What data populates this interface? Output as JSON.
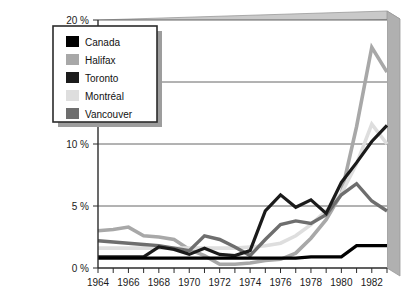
{
  "chart_data": {
    "type": "line",
    "title": "",
    "xlabel": "",
    "ylabel": "",
    "xlim": [
      1964,
      1983
    ],
    "ylim": [
      0,
      20
    ],
    "ytick_labels": [
      "0 %",
      "5 %",
      "10 %",
      "15 %",
      "20 %"
    ],
    "ytick_values": [
      0,
      5,
      10,
      15,
      20
    ],
    "xtick_values": [
      1964,
      1965,
      1966,
      1967,
      1968,
      1969,
      1970,
      1971,
      1972,
      1973,
      1974,
      1975,
      1976,
      1977,
      1978,
      1979,
      1980,
      1981,
      1982,
      1983
    ],
    "xtick_labels": [
      "1964",
      "1966",
      "1968",
      "1970",
      "1972",
      "1974",
      "1976",
      "1978",
      "1980",
      "1982"
    ],
    "xtick_label_values": [
      1964,
      1966,
      1968,
      1970,
      1972,
      1974,
      1976,
      1978,
      1980,
      1982
    ],
    "grid": "horizontal",
    "legend_position": "top-left",
    "x": [
      1964,
      1965,
      1966,
      1967,
      1968,
      1969,
      1970,
      1971,
      1972,
      1973,
      1974,
      1975,
      1976,
      1977,
      1978,
      1979,
      1980,
      1981,
      1982,
      1983
    ],
    "series": [
      {
        "name": "Canada",
        "color": "#000000",
        "width": 3.2,
        "values": [
          0.8,
          0.8,
          0.8,
          0.8,
          0.8,
          0.8,
          0.8,
          0.8,
          0.8,
          0.8,
          0.8,
          0.8,
          0.8,
          0.8,
          0.9,
          0.9,
          0.9,
          1.8,
          1.8,
          1.8
        ]
      },
      {
        "name": "Halifax",
        "color": "#a8a8a8",
        "width": 3.6,
        "values": [
          3.0,
          3.1,
          3.3,
          2.6,
          2.5,
          2.3,
          1.5,
          1.0,
          0.3,
          0.3,
          0.4,
          0.6,
          0.7,
          1.2,
          2.4,
          3.9,
          6.0,
          11.4,
          17.8,
          15.8
        ]
      },
      {
        "name": "Toronto",
        "color": "#1b1b1b",
        "width": 3.2,
        "values": [
          0.9,
          0.9,
          0.9,
          0.9,
          1.7,
          1.5,
          1.1,
          1.6,
          1.1,
          1.0,
          1.4,
          4.6,
          5.9,
          4.9,
          5.5,
          4.4,
          6.9,
          8.5,
          10.2,
          11.5
        ]
      },
      {
        "name": "Montréal",
        "color": "#dedede",
        "width": 3.6,
        "values": [
          1.6,
          1.6,
          1.6,
          1.6,
          1.6,
          1.6,
          1.6,
          1.6,
          1.6,
          1.6,
          1.7,
          1.8,
          2.0,
          2.6,
          3.5,
          4.6,
          6.0,
          8.4,
          11.6,
          10.0
        ]
      },
      {
        "name": "Vancouver",
        "color": "#6e6e6e",
        "width": 3.4,
        "values": [
          2.2,
          2.1,
          2.0,
          1.9,
          1.8,
          1.6,
          1.4,
          2.6,
          2.3,
          1.7,
          1.0,
          2.3,
          3.5,
          3.8,
          3.6,
          4.3,
          5.9,
          6.8,
          5.4,
          4.6
        ]
      }
    ]
  },
  "legend": {
    "items": [
      {
        "label": "Canada",
        "color": "#000000"
      },
      {
        "label": "Halifax",
        "color": "#a8a8a8"
      },
      {
        "label": "Toronto",
        "color": "#1b1b1b"
      },
      {
        "label": "Montréal",
        "color": "#dedede"
      },
      {
        "label": "Vancouver",
        "color": "#6e6e6e"
      }
    ]
  },
  "frame": {
    "face_color": "#ffffff",
    "top_color": "#c9c9c9",
    "right_color": "#b0b0b0",
    "edge_color": "#9a9a9a",
    "grid_color": "#555555",
    "axis_color": "#2b2b2b"
  }
}
